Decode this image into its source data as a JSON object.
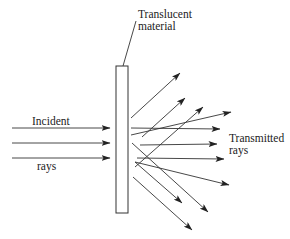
{
  "diagram": {
    "labels": {
      "material_line1": "Translucent",
      "material_line2": "material",
      "incident_top": "Incident",
      "incident_bottom": "rays",
      "transmitted_line1": "Transmitted",
      "transmitted_line2": "rays"
    },
    "slab": {
      "x": 116,
      "y": 66,
      "width": 12,
      "height": 147
    },
    "leader_line": {
      "x1": 123,
      "y1": 66,
      "x2": 136,
      "y2": 21
    },
    "incident_rays": [
      {
        "x1": 12,
        "y1": 128,
        "x2": 110,
        "y2": 128
      },
      {
        "x1": 12,
        "y1": 143,
        "x2": 110,
        "y2": 143
      },
      {
        "x1": 12,
        "y1": 158,
        "x2": 110,
        "y2": 158
      }
    ],
    "transmitted_rays": [
      {
        "x1": 131,
        "y1": 118,
        "x2": 180,
        "y2": 73
      },
      {
        "x1": 142,
        "y1": 137,
        "x2": 185,
        "y2": 98
      },
      {
        "x1": 135,
        "y1": 167,
        "x2": 203,
        "y2": 107
      },
      {
        "x1": 131,
        "y1": 135,
        "x2": 231,
        "y2": 112
      },
      {
        "x1": 131,
        "y1": 128,
        "x2": 220,
        "y2": 129
      },
      {
        "x1": 140,
        "y1": 145,
        "x2": 217,
        "y2": 144
      },
      {
        "x1": 137,
        "y1": 158,
        "x2": 224,
        "y2": 159
      },
      {
        "x1": 135,
        "y1": 162,
        "x2": 229,
        "y2": 185
      },
      {
        "x1": 132,
        "y1": 143,
        "x2": 208,
        "y2": 212
      },
      {
        "x1": 135,
        "y1": 162,
        "x2": 182,
        "y2": 203
      },
      {
        "x1": 133,
        "y1": 177,
        "x2": 192,
        "y2": 230
      }
    ]
  }
}
